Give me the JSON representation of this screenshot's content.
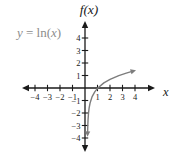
{
  "colors": {
    "axis": "#1a1a1a",
    "tick_text": "#1a1a1a",
    "curve": "#7d7d7d",
    "equation_label": "#8d8d8d",
    "background": "#ffffff"
  },
  "chart_data": {
    "type": "line",
    "title": "f(x)",
    "xlabel": "x",
    "ylabel": "f(x)",
    "annotation": "y = ln(x)",
    "annotation_parts": [
      {
        "t": "y",
        "italic": true
      },
      {
        "t": " = ln(",
        "italic": false
      },
      {
        "t": "x",
        "italic": true
      },
      {
        "t": ")",
        "italic": false
      }
    ],
    "x_ticks": [
      -4,
      -3,
      -2,
      -1,
      1,
      2,
      3,
      4
    ],
    "y_ticks": [
      -4,
      -3,
      -2,
      -1,
      1,
      2,
      3,
      4
    ],
    "xlim": [
      -5.2,
      5.6
    ],
    "ylim": [
      -5.2,
      5.4
    ],
    "grid": false,
    "legend": false,
    "series": [
      {
        "name": "y = ln(x)",
        "function": "ln(x)",
        "color": "#7d7d7d",
        "points": [
          [
            0.03,
            -3.51
          ],
          [
            0.05,
            -3.0
          ],
          [
            0.08,
            -2.53
          ],
          [
            0.13,
            -2.04
          ],
          [
            0.2,
            -1.61
          ],
          [
            0.3,
            -1.2
          ],
          [
            0.5,
            -0.69
          ],
          [
            0.75,
            -0.29
          ],
          [
            1.0,
            0.0
          ],
          [
            1.5,
            0.41
          ],
          [
            2.0,
            0.69
          ],
          [
            2.7,
            0.99
          ],
          [
            3.3,
            1.19
          ],
          [
            3.7,
            1.31
          ]
        ]
      }
    ]
  }
}
